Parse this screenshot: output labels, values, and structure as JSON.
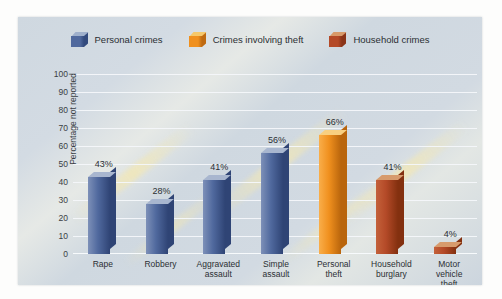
{
  "chart_data": {
    "type": "bar",
    "title": "",
    "xlabel": "",
    "ylabel": "Percentage not reported",
    "ylim": [
      0,
      100
    ],
    "ytick_step": 10,
    "yticks": [
      "100",
      "90",
      "80",
      "70",
      "60",
      "50",
      "40",
      "30",
      "20",
      "10",
      "0"
    ],
    "grid": true,
    "legend_position": "top-center",
    "categories": [
      "Rape",
      "Robbery",
      "Aggravated assault",
      "Simple assault",
      "Personal theft",
      "Household burglary",
      "Motor vehicle theft"
    ],
    "values": [
      43,
      28,
      41,
      56,
      66,
      41,
      4
    ],
    "value_labels": [
      "43%",
      "28%",
      "41%",
      "56%",
      "66%",
      "41%",
      "4%"
    ],
    "bar_groups": [
      "Personal crimes",
      "Personal crimes",
      "Personal crimes",
      "Personal crimes",
      "Crimes involving theft",
      "Household crimes",
      "Household crimes"
    ],
    "legend": [
      {
        "label": "Personal crimes",
        "color": "#50699e"
      },
      {
        "label": "Crimes involving theft",
        "color": "#f0901e"
      },
      {
        "label": "Household crimes",
        "color": "#b44a28"
      }
    ]
  },
  "colors": {
    "personal_front": "#50699e",
    "personal_top": "#9fb0cc",
    "personal_side": "#2c3e६b",
    "theft_front": "#f0901e",
    "theft_top": "#f6c86a",
    "theft_side": "#bf6a10",
    "household_front": "#b44a28",
    "household_top": "#d89a6a",
    "household_side": "#8a3418",
    "panel_bg": "#d2dae2",
    "gridline": "#f4f7fa",
    "text": "#2b2f33"
  }
}
